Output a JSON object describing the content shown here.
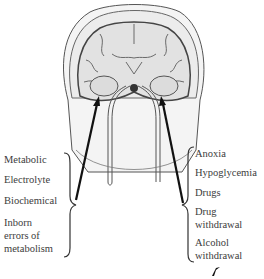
{
  "figure": {
    "left_group": {
      "items": [
        {
          "label": "Metabolic"
        },
        {
          "label": "Electrolyte"
        },
        {
          "label": "Biochemical"
        },
        {
          "label_line1": "Inborn",
          "label_line2": "errors of",
          "label_line3": "metabolism"
        }
      ]
    },
    "right_group": {
      "items": [
        {
          "label": "Anoxia"
        },
        {
          "label": "Hypoglycemia"
        },
        {
          "label": "Drugs"
        },
        {
          "label_line1": "Drug",
          "label_line2": "withdrawal"
        },
        {
          "label_line1": "Alcohol",
          "label_line2": "withdrawal"
        }
      ]
    },
    "colors": {
      "outline": "#2a2a2a",
      "skin": "#f2f2f2",
      "brain": "#e6e6e6",
      "gray_matter": "#9a9a9a",
      "arrow": "#111111",
      "text": "#3c3c3c"
    }
  }
}
